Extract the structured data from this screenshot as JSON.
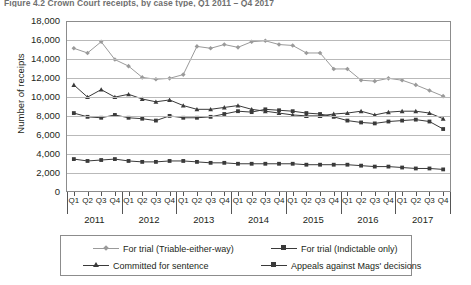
{
  "figure": {
    "title": "Figure 4.2  Crown Court receipts, by case type, Q1 2011 – Q4 2017",
    "ylabel": "Number of receipts"
  },
  "legend": {
    "items": [
      {
        "label": "For trial (Triable-either-way)",
        "marker": "diamond",
        "color": "#9a9a9a"
      },
      {
        "label": "For trial (Indictable only)",
        "marker": "square",
        "color": "#3a3a3a"
      },
      {
        "label": "Committed for sentence",
        "marker": "triangle",
        "color": "#3a3a3a"
      },
      {
        "label": "Appeals against Mags' decisions",
        "marker": "square",
        "color": "#3a3a3a"
      }
    ]
  },
  "axes": {
    "yticks": [
      "18,000",
      "16,000",
      "14,000",
      "12,000",
      "10,000",
      "8,000",
      "6,000",
      "4,000",
      "2,000",
      "0"
    ],
    "quarters": [
      "Q1",
      "Q2",
      "Q3",
      "Q4"
    ],
    "years": [
      "2011",
      "2012",
      "2013",
      "2014",
      "2015",
      "2016",
      "2017"
    ]
  },
  "chart_data": {
    "type": "line",
    "title": "Figure 4.2  Crown Court receipts, by case type, Q1 2011 – Q4 2017",
    "xlabel": "",
    "ylabel": "Number of receipts",
    "ylim": [
      0,
      18000
    ],
    "ytick_step": 2000,
    "grid": true,
    "legend_position": "bottom",
    "x": [
      "Q1 2011",
      "Q2 2011",
      "Q3 2011",
      "Q4 2011",
      "Q1 2012",
      "Q2 2012",
      "Q3 2012",
      "Q4 2012",
      "Q1 2013",
      "Q2 2013",
      "Q3 2013",
      "Q4 2013",
      "Q1 2014",
      "Q2 2014",
      "Q3 2014",
      "Q4 2014",
      "Q1 2015",
      "Q2 2015",
      "Q3 2015",
      "Q4 2015",
      "Q1 2016",
      "Q2 2016",
      "Q3 2016",
      "Q4 2016",
      "Q1 2017",
      "Q2 2017",
      "Q3 2017",
      "Q4 2017"
    ],
    "series": [
      {
        "name": "For trial (Triable-either-way)",
        "marker": "diamond",
        "color": "#9a9a9a",
        "values": [
          15200,
          14700,
          15900,
          14000,
          13300,
          12100,
          11900,
          12000,
          12400,
          15400,
          15200,
          15600,
          15300,
          15900,
          16000,
          15600,
          15500,
          14700,
          14700,
          13000,
          13000,
          11800,
          11700,
          12000,
          11800,
          11300,
          10700,
          10100
        ]
      },
      {
        "name": "For trial (Indictable only)",
        "marker": "square",
        "color": "#3a3a3a",
        "values": [
          8300,
          7900,
          7800,
          8100,
          7800,
          7700,
          7500,
          8000,
          7800,
          7800,
          7900,
          8200,
          8500,
          8400,
          8700,
          8600,
          8500,
          8300,
          8200,
          7900,
          7500,
          7300,
          7200,
          7400,
          7500,
          7600,
          7400,
          6600
        ]
      },
      {
        "name": "Committed for sentence",
        "marker": "triangle",
        "color": "#3a3a3a",
        "values": [
          11300,
          10000,
          10800,
          10000,
          10300,
          9800,
          9500,
          9700,
          9100,
          8700,
          8700,
          8900,
          9100,
          8700,
          8500,
          8300,
          8100,
          8000,
          8000,
          8200,
          8300,
          8500,
          8100,
          8400,
          8500,
          8500,
          8300,
          7700
        ]
      },
      {
        "name": "Appeals against Mags' decisions",
        "marker": "square",
        "color": "#3a3a3a",
        "values": [
          3400,
          3200,
          3300,
          3400,
          3200,
          3100,
          3100,
          3200,
          3200,
          3100,
          3000,
          3000,
          2900,
          2900,
          2900,
          2900,
          2900,
          2800,
          2800,
          2800,
          2800,
          2700,
          2600,
          2600,
          2500,
          2400,
          2400,
          2300
        ]
      }
    ]
  }
}
